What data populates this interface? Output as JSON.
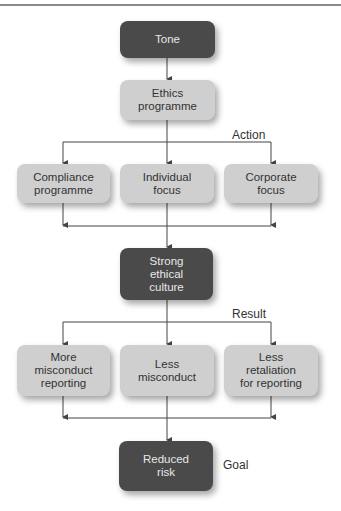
{
  "diagram": {
    "nodes": {
      "tone": "Tone",
      "ethics": "Ethics\nprogramme",
      "compliance": "Compliance\nprogramme",
      "individual": "Individual\nfocus",
      "corporate": "Corporate\nfocus",
      "culture": "Strong\nethical\nculture",
      "reporting": "More\nmisconduct\nreporting",
      "misconduct": "Less\nmisconduct",
      "retaliation": "Less\nretaliation\nfor reporting",
      "risk": "Reduced\nrisk"
    },
    "labels": {
      "action": "Action",
      "result": "Result",
      "goal": "Goal"
    }
  },
  "colors": {
    "dark_box": "#4a4a4a",
    "light_box": "#cfcfcf",
    "line": "#444444"
  }
}
